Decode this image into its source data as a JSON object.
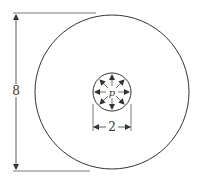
{
  "diagram": {
    "outer_circle": {
      "diameter_label": "8",
      "cx": 112,
      "cy": 92,
      "r": 77
    },
    "inner_circle": {
      "diameter_label": "2",
      "cx": 112,
      "cy": 92,
      "r": 19,
      "pressure_label": "p"
    },
    "stroke_color": "#333333",
    "background": "#ffffff"
  }
}
